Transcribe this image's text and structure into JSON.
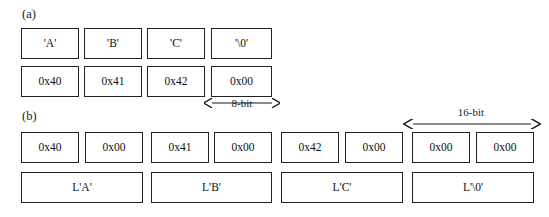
{
  "figure": {
    "panels": [
      {
        "id": "a",
        "label": "(a)",
        "rows": [
          {
            "id": "a-chars",
            "cells": [
              "'A'",
              "'B'",
              "'C'",
              "'\\0'"
            ]
          },
          {
            "id": "a-bytes",
            "cells": [
              "0x40",
              "0x41",
              "0x42",
              "0x00"
            ]
          }
        ],
        "dimension": {
          "label": "8-bit"
        }
      },
      {
        "id": "b",
        "label": "(b)",
        "rows": [
          {
            "id": "b-bytes",
            "cells": [
              "0x40",
              "0x00",
              "0x41",
              "0x00",
              "0x42",
              "0x00",
              "0x00",
              "0x00"
            ]
          },
          {
            "id": "b-wchars",
            "cells": [
              "L'A'",
              "L'B'",
              "L'C'",
              "L'\\0'"
            ]
          }
        ],
        "dimension": {
          "label": "16-bit"
        }
      }
    ]
  },
  "colors": {
    "background": "#ffffff",
    "box_border": "#222222",
    "text": "#1a1a1a"
  }
}
